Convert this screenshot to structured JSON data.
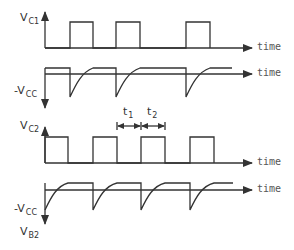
{
  "diagram": {
    "type": "timing-waveforms",
    "axis_label": "time",
    "colors": {
      "trace": "#333333",
      "axis": "#333333",
      "text": "#444444"
    },
    "waveforms": [
      {
        "id": "vc1",
        "label_main": "V",
        "label_sub": "C1",
        "kind": "square",
        "x_label": "time"
      },
      {
        "id": "vb1",
        "label_main": "-V",
        "label_sub": "CC",
        "kind": "exponential-recovery",
        "x_label": "time"
      },
      {
        "id": "vc2",
        "label_main": "V",
        "label_sub": "C2",
        "kind": "square",
        "x_label": "time"
      },
      {
        "id": "vb2",
        "label_main": "-V",
        "label_sub": "CC",
        "kind": "exponential-recovery",
        "x_label": "time",
        "axis_label_main": "V",
        "axis_label_sub": "B2"
      }
    ],
    "intervals": [
      {
        "label_main": "t",
        "label_sub": "1"
      },
      {
        "label_main": "t",
        "label_sub": "2"
      }
    ]
  }
}
